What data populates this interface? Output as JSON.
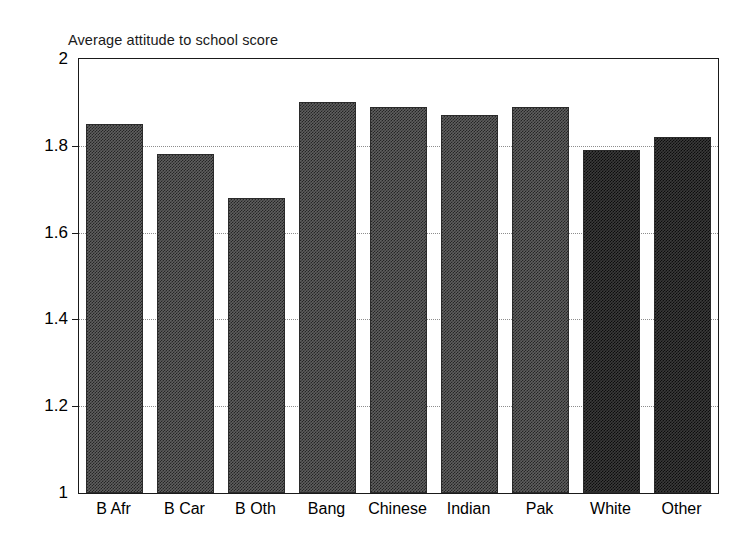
{
  "chart_data": {
    "type": "bar",
    "title": "Average attitude to school score",
    "xlabel": "",
    "ylabel": "",
    "ylim": [
      1,
      2
    ],
    "yticks": [
      "1",
      "1.2",
      "1.4",
      "1.6",
      "1.8",
      "2"
    ],
    "ytick_values": [
      1,
      1.2,
      1.4,
      1.6,
      1.8,
      2
    ],
    "grid": true,
    "grid_axis": "y",
    "legend": null,
    "categories": [
      "B Afr",
      "B Car",
      "B Oth",
      "Bang",
      "Chinese",
      "Indian",
      "Pak",
      "White",
      "Other"
    ],
    "values": [
      1.85,
      1.78,
      1.68,
      1.9,
      1.89,
      1.87,
      1.89,
      1.79,
      1.82
    ],
    "bar_shades": [
      "mid",
      "mid",
      "mid",
      "mid",
      "mid",
      "mid",
      "mid",
      "dark",
      "dark"
    ]
  }
}
